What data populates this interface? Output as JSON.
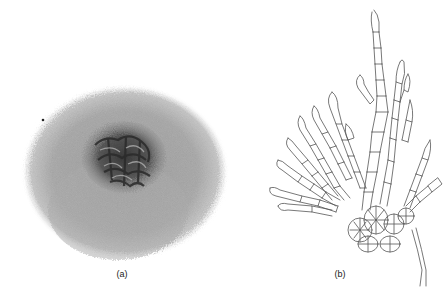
{
  "figure": {
    "panels": [
      {
        "label": "(a)",
        "content": "photograph of fungal colony with dark wrinkled center and grey fuzzy margin"
      },
      {
        "label": "(b)",
        "content": "line drawing of branching septate hyphae / conidial chains"
      }
    ]
  }
}
